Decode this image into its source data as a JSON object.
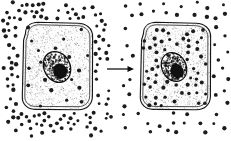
{
  "figure": {
    "caption": "",
    "background_color": "#ffffff",
    "ink_color": "#1c1c1c",
    "width": 231,
    "height": 141
  },
  "panels": [
    {
      "id": "left-cell-panel",
      "label": "",
      "description": "Cell with high solute concentration outside, low inside",
      "cell": {
        "name": "left-cell",
        "outline_color": "#151515",
        "fill_color": "#fdfdfd",
        "bounds": {
          "x": 21,
          "y": 22,
          "width": 72,
          "height": 88
        },
        "nucleus": {
          "name": "left-nucleus",
          "center_x": 57,
          "center_y": 67,
          "radius_x": 13,
          "radius_y": 16,
          "rotation": -28,
          "fill_color": "#ffffff",
          "outline_color": "#0d0d0d",
          "nucleolus": {
            "center_x": 60,
            "center_y": 71,
            "radius_x": 6.5,
            "radius_y": 7.5,
            "rotation": -28,
            "color": "#111111"
          }
        }
      },
      "solute": {
        "label": "solute particles",
        "dot_color": "#1c1c1c",
        "dot_radius": 1.75,
        "inside_count": 19,
        "outside_count": 118,
        "distribution": "concentrated outside"
      }
    },
    {
      "id": "right-cell-panel",
      "label": "",
      "description": "Cell after diffusion, solute evenly distributed inside and outside",
      "cell": {
        "name": "right-cell",
        "outline_color": "#151515",
        "fill_color": "#fdfdfd",
        "bounds": {
          "x": 139,
          "y": 22,
          "width": 72,
          "height": 88
        },
        "nucleus": {
          "name": "right-nucleus",
          "center_x": 174,
          "center_y": 67,
          "radius_x": 12,
          "radius_y": 15,
          "rotation": -28,
          "fill_color": "#ffffff",
          "outline_color": "#0d0d0d",
          "nucleolus": {
            "center_x": 177,
            "center_y": 71,
            "radius_x": 6,
            "radius_y": 7,
            "rotation": -28,
            "color": "#111111"
          }
        }
      },
      "solute": {
        "label": "solute particles",
        "dot_color": "#1c1c1c",
        "dot_radius": 1.75,
        "inside_count": 58,
        "outside_count": 52,
        "distribution": "evenly distributed"
      }
    }
  ],
  "arrow": {
    "name": "process-arrow",
    "label": "",
    "direction": "right",
    "color": "#0a0a0a",
    "x1": 107,
    "y1": 69,
    "x2": 134,
    "y2": 69
  },
  "chart_data": {
    "type": "diagram",
    "panels": [
      "before",
      "after"
    ],
    "series": [
      {
        "name": "outside solute dots",
        "values": [
          118,
          52
        ]
      },
      {
        "name": "inside solute dots",
        "values": [
          19,
          58
        ]
      }
    ],
    "categories": [
      "left cell (before)",
      "right cell (after)"
    ]
  },
  "geometry": {
    "left_cell_path": "M25.5,33.5 C25.5,26.5 30.5,22.5 38,22.3 L78,23.2 C86.5,23.5 92.5,28.5 92.6,36.5 L92.4,96.5 C92.3,104.5 86.5,109.6 78.5,109.7 L35,109.4 C27.5,109.2 22.2,104.5 22.3,97 L23.6,40 Z",
    "left_cell_inner_path": "M28,34.6 C28,28.6 32,25 38.4,24.8 L77.6,25.7 C84.8,26 89.8,30.2 89.9,37 L89.7,95.6 C89.6,102.4 84.8,106.6 78.2,106.7 L35.4,106.4 C29,106.2 24.7,102.4 24.8,96.2 L26.1,40.4 Z",
    "right_cell_path": "M143.5,33.5 C143.5,26.5 148.5,22.5 156,22.3 L196,23.2 C204.5,23.5 210.5,28.5 210.6,36.5 L210.4,96.5 C210.3,104.5 204.5,109.6 196.5,109.7 L153,109.4 C145.5,109.2 140.2,104.5 140.3,97 L141.6,40 Z",
    "right_cell_inner_path": "M146,34.6 C146,28.6 150,25 156.4,24.8 L195.6,25.7 C202.8,26 207.8,30.2 207.9,37 L207.7,95.6 C207.6,102.4 202.8,106.6 196.2,106.7 L153.4,106.4 C147,106.2 142.7,102.4 142.8,96.2 L144.1,40.4 Z"
  }
}
